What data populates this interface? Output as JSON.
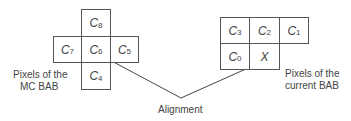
{
  "diagram": {
    "mc_bab": {
      "label_line1": "Pixels of the",
      "label_line2": "MC BAB",
      "cells": [
        {
          "id": "C8",
          "base": "C",
          "sub": "8"
        },
        {
          "id": "C7",
          "base": "C",
          "sub": "7"
        },
        {
          "id": "C6",
          "base": "C",
          "sub": "6"
        },
        {
          "id": "C5",
          "base": "C",
          "sub": "5"
        },
        {
          "id": "C4",
          "base": "C",
          "sub": "4"
        }
      ]
    },
    "current_bab": {
      "label_line1": "Pixels of the",
      "label_line2": "current BAB",
      "cells": [
        {
          "id": "C3",
          "base": "C",
          "sub": "3"
        },
        {
          "id": "C2",
          "base": "C",
          "sub": "2"
        },
        {
          "id": "C1",
          "base": "C",
          "sub": "1"
        },
        {
          "id": "C0",
          "base": "C",
          "sub": "0"
        },
        {
          "id": "X",
          "base": "X",
          "sub": ""
        }
      ]
    },
    "alignment_label": "Alignment",
    "line_color": "#444444"
  }
}
